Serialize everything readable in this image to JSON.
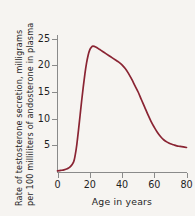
{
  "chart_data": {
    "type": "line",
    "title": "",
    "xlabel": "Age in years",
    "ylabel_line1": "Rate of testosterone secretion, milligrams",
    "ylabel_line2": "per 100 milliliters of andosterone in plasma",
    "xlim": [
      0,
      80
    ],
    "ylim": [
      0,
      26
    ],
    "xticks": [
      0,
      20,
      40,
      60,
      80
    ],
    "xtick_labels": [
      "0",
      "20",
      "40",
      "60",
      "80"
    ],
    "yticks": [
      5,
      10,
      15,
      20,
      25
    ],
    "ytick_labels": [
      "5",
      "10",
      "15",
      "20",
      "25"
    ],
    "grid": false,
    "legend": "none",
    "series": [
      {
        "name": "Testosterone secretion rate",
        "color": "#8a2433",
        "x": [
          0,
          2,
          4,
          6,
          8,
          10,
          11,
          12,
          13,
          14,
          15,
          16,
          17,
          18,
          19,
          20,
          21,
          22,
          24,
          26,
          28,
          30,
          32,
          34,
          36,
          38,
          40,
          42,
          44,
          46,
          48,
          50,
          52,
          54,
          56,
          58,
          60,
          62,
          64,
          66,
          68,
          70,
          72,
          74,
          76,
          78,
          80
        ],
        "y": [
          0.2,
          0.3,
          0.4,
          0.6,
          1.0,
          1.9,
          3.2,
          5.2,
          7.8,
          10.6,
          13.4,
          16.0,
          18.4,
          20.4,
          21.9,
          22.9,
          23.4,
          23.6,
          23.4,
          23.0,
          22.6,
          22.2,
          21.8,
          21.4,
          21.0,
          20.6,
          20.1,
          19.4,
          18.5,
          17.4,
          16.2,
          15.0,
          13.6,
          12.2,
          10.8,
          9.5,
          8.4,
          7.4,
          6.6,
          6.0,
          5.6,
          5.3,
          5.1,
          4.9,
          4.8,
          4.7,
          4.6
        ]
      }
    ]
  },
  "axes": {
    "line_color": "#8a8a8a",
    "text_color": "#1e1e1e"
  },
  "figure": {
    "background": "#f6f4f1"
  }
}
